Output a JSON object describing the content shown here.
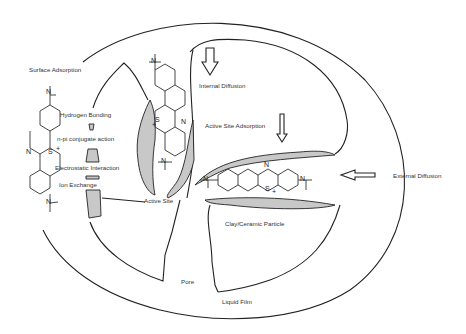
{
  "diagram": {
    "labels": {
      "surface_adsorption": "Surface Adsorption",
      "hydrogen_bonding": "Hydrogen Bonding",
      "n_pi": "n-pi conjugate action",
      "electrostatic": "Electrostatic Interaction",
      "ion_exchange": "Ion Exchange",
      "active_site": "Active Site",
      "internal_diffusion": "Internal Diffusion",
      "active_site_adsorption": "Active Site Adsorption",
      "external_diffusion": "External Diffusion",
      "clay_particle": "Clay/Ceramic Particle",
      "pore": "Pore",
      "liquid_film": "Liquid Film"
    },
    "atoms": {
      "n": "N",
      "s": "S",
      "plus": "+"
    },
    "colors": {
      "line": "#222222",
      "shade": "#c8c8c8",
      "text": "#333333",
      "background": "#ffffff"
    }
  }
}
